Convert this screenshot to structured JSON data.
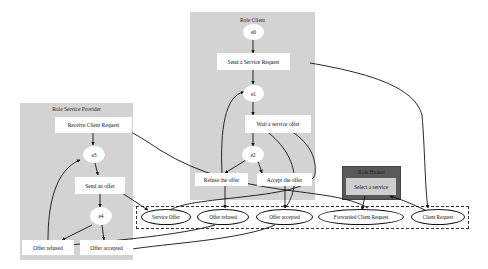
{
  "diagram": {
    "clusters": {
      "client": {
        "title": "Role Client"
      },
      "provider": {
        "title": "Role Service Provider"
      },
      "broker": {
        "title": "Role Broker"
      }
    },
    "client_nodes": {
      "e0": "e0",
      "send_request": "Send a Service Request",
      "e1": "e1",
      "wait_offer": "Wait a service offer",
      "e2": "e2",
      "refuse_offer": "Refuse the offer",
      "accept_offer": "Accept the offer"
    },
    "provider_nodes": {
      "receive_request": "Receive Client Request",
      "e3": "e3",
      "send_offer": "Send an offer",
      "e4": "e4",
      "offer_refused": "Offer refused",
      "offer_accepted": "Offer accepted"
    },
    "broker_nodes": {
      "select_service": "Select a service"
    },
    "messages": [
      "Service Offer",
      "Offer refused",
      "Offer accepted",
      "Forwarded Client Request",
      "Client Request"
    ],
    "colors": {
      "cluster_fill": "#d3d3d3",
      "broker_fill": "#5a5a5a",
      "broker_node_fill": "#cfcfcf",
      "node_fill": "#ffffff",
      "edge": "#111111"
    }
  }
}
